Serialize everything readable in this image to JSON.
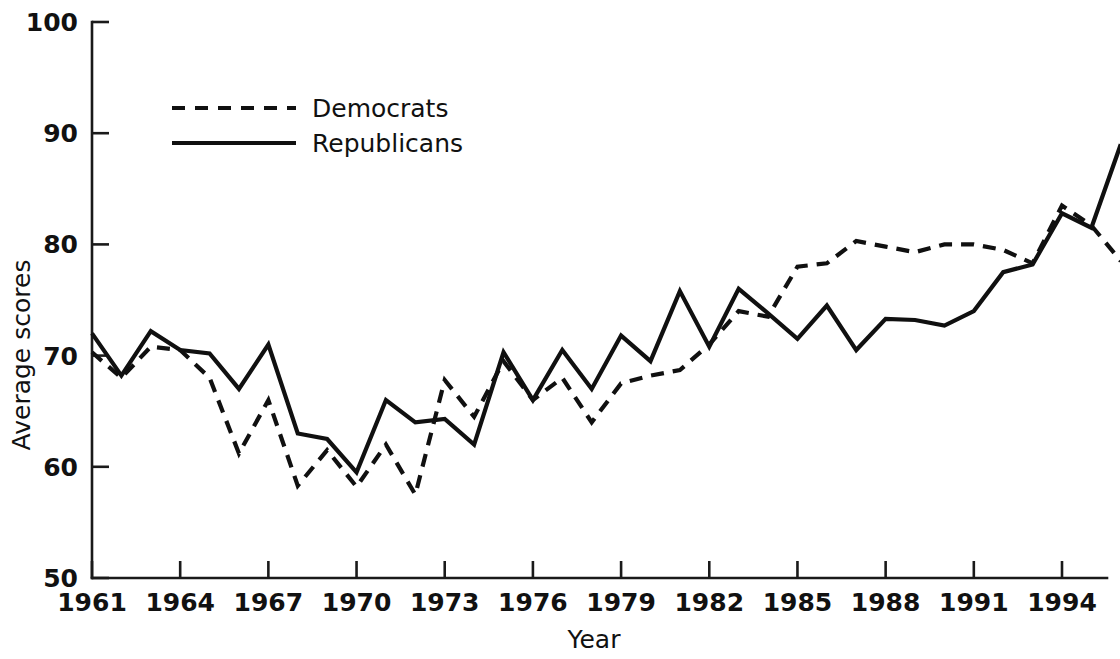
{
  "chart_data": {
    "type": "line",
    "title": "",
    "xlabel": "Year",
    "ylabel": "Average scores",
    "xlim": [
      1961,
      1996
    ],
    "ylim": [
      50,
      100
    ],
    "xticks": [
      1961,
      1964,
      1967,
      1970,
      1973,
      1976,
      1979,
      1982,
      1985,
      1988,
      1991,
      1994
    ],
    "yticks": [
      50,
      60,
      70,
      80,
      90,
      100
    ],
    "xtick_labels": [
      "1961",
      "1964",
      "1967",
      "1970",
      "1973",
      "1976",
      "1979",
      "1982",
      "1985",
      "1988",
      "1991",
      "1994"
    ],
    "ytick_labels": [
      "50",
      "60",
      "70",
      "80",
      "90",
      "100"
    ],
    "grid": false,
    "legend_position": "upper-left-inside",
    "x": [
      1961,
      1962,
      1963,
      1964,
      1965,
      1966,
      1967,
      1968,
      1969,
      1970,
      1971,
      1972,
      1973,
      1974,
      1975,
      1976,
      1977,
      1978,
      1979,
      1980,
      1981,
      1982,
      1983,
      1984,
      1985,
      1986,
      1987,
      1988,
      1989,
      1990,
      1991,
      1992,
      1993,
      1994,
      1995,
      1996
    ],
    "series": [
      {
        "name": "Democrats",
        "style": "dashed",
        "color": "#101010",
        "values": [
          70.3,
          68.0,
          70.8,
          70.5,
          68.0,
          61.2,
          66.0,
          58.3,
          61.5,
          58.2,
          62.0,
          57.5,
          67.8,
          64.5,
          69.5,
          66.0,
          68.0,
          64.0,
          67.5,
          68.2,
          68.7,
          71.0,
          74.0,
          73.5,
          78.0,
          78.3,
          80.3,
          79.8,
          79.3,
          80.0,
          80.0,
          79.5,
          78.3,
          83.5,
          81.7,
          78.5
        ]
      },
      {
        "name": "Republicans",
        "style": "solid",
        "color": "#101010",
        "values": [
          72.0,
          68.2,
          72.2,
          70.5,
          70.2,
          67.0,
          71.0,
          63.0,
          62.5,
          59.5,
          66.0,
          64.0,
          64.3,
          62.0,
          70.3,
          66.0,
          70.5,
          67.0,
          71.8,
          69.5,
          75.8,
          70.8,
          76.0,
          73.8,
          71.5,
          74.5,
          70.5,
          73.3,
          73.2,
          72.7,
          74.0,
          77.5,
          78.2,
          82.8,
          81.5,
          89.0
        ]
      }
    ]
  },
  "legend": {
    "entries": [
      {
        "label": "Democrats",
        "style": "dashed"
      },
      {
        "label": "Republicans",
        "style": "solid"
      }
    ]
  }
}
